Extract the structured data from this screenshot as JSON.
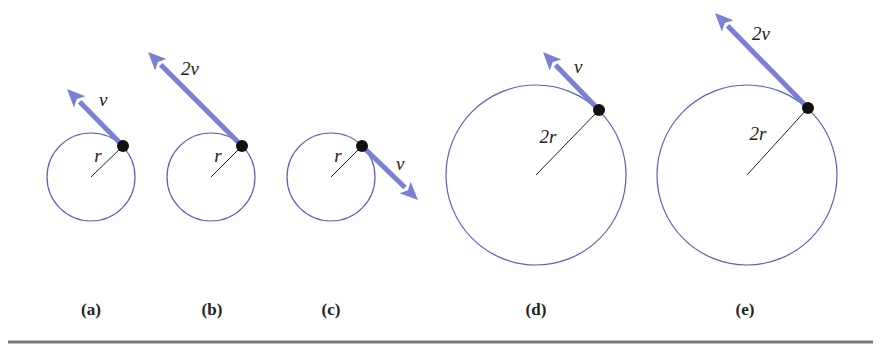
{
  "diagram": {
    "colors": {
      "circle": "#5a5fc0",
      "arrow": "#7b7fd6",
      "radius": "#222222",
      "dot": "#111111",
      "rule": "#7a7a7a"
    },
    "panels": [
      {
        "id": "a",
        "caption": "(a)",
        "radius_label": "r",
        "velocity_label": "v",
        "cx": 91,
        "cy": 177,
        "r": 44,
        "px": 123,
        "py": 146,
        "tipx": 67,
        "tipy": 89,
        "vx": 99,
        "vy": 106,
        "rlx": 98,
        "rly": 162,
        "capx": 91
      },
      {
        "id": "b",
        "caption": "(b)",
        "radius_label": "r",
        "velocity_label": "2v",
        "cx": 211,
        "cy": 177,
        "r": 44,
        "px": 242,
        "py": 146,
        "tipx": 148,
        "tipy": 52,
        "vx": 181,
        "vy": 75,
        "rlx": 218,
        "rly": 162,
        "capx": 212
      },
      {
        "id": "c",
        "caption": "(c)",
        "radius_label": "r",
        "velocity_label": "v",
        "cx": 331,
        "cy": 177,
        "r": 44,
        "px": 362,
        "py": 146,
        "tipx": 418,
        "tipy": 200,
        "vx": 396,
        "vy": 170,
        "rlx": 338,
        "rly": 162,
        "capx": 331
      },
      {
        "id": "d",
        "caption": "(d)",
        "radius_label": "2r",
        "velocity_label": "v",
        "cx": 536,
        "cy": 175,
        "r": 90,
        "px": 599,
        "py": 110,
        "tipx": 543,
        "tipy": 52,
        "vx": 574,
        "vy": 73,
        "rlx": 548,
        "rly": 143,
        "capx": 536
      },
      {
        "id": "e",
        "caption": "(e)",
        "radius_label": "2r",
        "velocity_label": "2v",
        "cx": 747,
        "cy": 175,
        "r": 90,
        "px": 808,
        "py": 108,
        "tipx": 715,
        "tipy": 13,
        "vx": 752,
        "vy": 40,
        "rlx": 758,
        "rly": 140,
        "capx": 745
      }
    ]
  }
}
